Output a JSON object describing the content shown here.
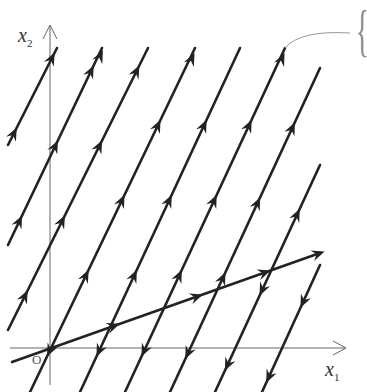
{
  "diagram": {
    "type": "phase-portrait",
    "axes": {
      "x_label": "x",
      "x_sub": "1",
      "y_label": "x",
      "y_sub": "2",
      "origin_label": "O"
    },
    "colors": {
      "trajectory": "#222222",
      "axis": "#555555",
      "annotation": "#888888"
    },
    "fast_lines": [
      {
        "x1": 8,
        "y1": 145,
        "x2": 57,
        "y2": 48,
        "dir": "up"
      },
      {
        "x1": 8,
        "y1": 245,
        "x2": 102,
        "y2": 48,
        "dir": "up"
      },
      {
        "x1": 8,
        "y1": 330,
        "x2": 148,
        "y2": 48,
        "dir": "up"
      },
      {
        "x1": 30,
        "y1": 392,
        "x2": 195,
        "y2": 48,
        "dir": "up_above_down_below"
      },
      {
        "x1": 80,
        "y1": 392,
        "x2": 240,
        "y2": 48,
        "dir": "up_above_down_below"
      },
      {
        "x1": 125,
        "y1": 392,
        "x2": 285,
        "y2": 48,
        "dir": "up_above_down_below"
      },
      {
        "x1": 170,
        "y1": 392,
        "x2": 320,
        "y2": 68,
        "dir": "up_above_down_below"
      },
      {
        "x1": 215,
        "y1": 392,
        "x2": 320,
        "y2": 165,
        "dir": "up_above_down_below"
      },
      {
        "x1": 262,
        "y1": 392,
        "x2": 320,
        "y2": 265,
        "dir": "down"
      }
    ],
    "slow_line": {
      "x1": 12,
      "y1": 362,
      "x2": 320,
      "y2": 253
    },
    "annotation_brace": "{"
  }
}
